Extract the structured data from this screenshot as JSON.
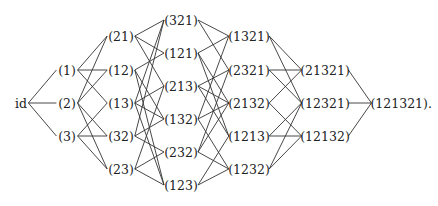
{
  "diagram": {
    "type": "hasse-diagram",
    "title": "",
    "levels": [
      {
        "rank": 0,
        "nodes": [
          {
            "id": "id",
            "label": "id",
            "x": 21,
            "y": 103
          }
        ]
      },
      {
        "rank": 1,
        "nodes": [
          {
            "id": "1",
            "label": "(1)",
            "x": 67,
            "y": 70
          },
          {
            "id": "2",
            "label": "(2)",
            "x": 67,
            "y": 103
          },
          {
            "id": "3",
            "label": "(3)",
            "x": 67,
            "y": 136
          }
        ]
      },
      {
        "rank": 2,
        "nodes": [
          {
            "id": "21",
            "label": "(21)",
            "x": 121,
            "y": 36
          },
          {
            "id": "12",
            "label": "(12)",
            "x": 121,
            "y": 70
          },
          {
            "id": "13",
            "label": "(13)",
            "x": 121,
            "y": 103
          },
          {
            "id": "32",
            "label": "(32)",
            "x": 121,
            "y": 136
          },
          {
            "id": "23",
            "label": "(23)",
            "x": 121,
            "y": 169
          }
        ]
      },
      {
        "rank": 3,
        "nodes": [
          {
            "id": "321",
            "label": "(321)",
            "x": 181,
            "y": 20
          },
          {
            "id": "121",
            "label": "(121)",
            "x": 181,
            "y": 53
          },
          {
            "id": "213",
            "label": "(213)",
            "x": 181,
            "y": 86
          },
          {
            "id": "132",
            "label": "(132)",
            "x": 181,
            "y": 119
          },
          {
            "id": "232",
            "label": "(232)",
            "x": 181,
            "y": 152
          },
          {
            "id": "123",
            "label": "(123)",
            "x": 181,
            "y": 185
          }
        ]
      },
      {
        "rank": 4,
        "nodes": [
          {
            "id": "1321",
            "label": "(1321)",
            "x": 249,
            "y": 36
          },
          {
            "id": "2321",
            "label": "(2321)",
            "x": 249,
            "y": 70
          },
          {
            "id": "2132",
            "label": "(2132)",
            "x": 249,
            "y": 103
          },
          {
            "id": "1213",
            "label": "(1213)",
            "x": 249,
            "y": 136
          },
          {
            "id": "1232",
            "label": "(1232)",
            "x": 249,
            "y": 169
          }
        ]
      },
      {
        "rank": 5,
        "nodes": [
          {
            "id": "21321",
            "label": "(21321)",
            "x": 325,
            "y": 70
          },
          {
            "id": "12321",
            "label": "(12321)",
            "x": 325,
            "y": 103
          },
          {
            "id": "12132",
            "label": "(12132)",
            "x": 325,
            "y": 136
          }
        ]
      },
      {
        "rank": 6,
        "nodes": [
          {
            "id": "121321",
            "label": "(121321).",
            "x": 398,
            "y": 103
          }
        ]
      }
    ],
    "edges": [
      [
        "id",
        "1"
      ],
      [
        "id",
        "2"
      ],
      [
        "id",
        "3"
      ],
      [
        "1",
        "21"
      ],
      [
        "1",
        "12"
      ],
      [
        "1",
        "13"
      ],
      [
        "2",
        "21"
      ],
      [
        "2",
        "12"
      ],
      [
        "2",
        "32"
      ],
      [
        "2",
        "23"
      ],
      [
        "3",
        "13"
      ],
      [
        "3",
        "32"
      ],
      [
        "3",
        "23"
      ],
      [
        "21",
        "321"
      ],
      [
        "21",
        "121"
      ],
      [
        "21",
        "213"
      ],
      [
        "12",
        "121"
      ],
      [
        "12",
        "132"
      ],
      [
        "12",
        "123"
      ],
      [
        "13",
        "321"
      ],
      [
        "13",
        "213"
      ],
      [
        "13",
        "132"
      ],
      [
        "13",
        "123"
      ],
      [
        "32",
        "321"
      ],
      [
        "32",
        "132"
      ],
      [
        "32",
        "232"
      ],
      [
        "23",
        "213"
      ],
      [
        "23",
        "232"
      ],
      [
        "23",
        "123"
      ],
      [
        "321",
        "1321"
      ],
      [
        "321",
        "2321"
      ],
      [
        "121",
        "1321"
      ],
      [
        "121",
        "2132"
      ],
      [
        "121",
        "1213"
      ],
      [
        "213",
        "2321"
      ],
      [
        "213",
        "2132"
      ],
      [
        "213",
        "1213"
      ],
      [
        "132",
        "1321"
      ],
      [
        "132",
        "2132"
      ],
      [
        "132",
        "1232"
      ],
      [
        "232",
        "2321"
      ],
      [
        "232",
        "2132"
      ],
      [
        "232",
        "1232"
      ],
      [
        "123",
        "1213"
      ],
      [
        "123",
        "1232"
      ],
      [
        "1321",
        "21321"
      ],
      [
        "1321",
        "12321"
      ],
      [
        "2321",
        "21321"
      ],
      [
        "2321",
        "12321"
      ],
      [
        "2132",
        "21321"
      ],
      [
        "2132",
        "12132"
      ],
      [
        "1213",
        "12321"
      ],
      [
        "1213",
        "12132"
      ],
      [
        "1232",
        "12321"
      ],
      [
        "1232",
        "12132"
      ],
      [
        "21321",
        "121321"
      ],
      [
        "12321",
        "121321"
      ],
      [
        "12132",
        "121321"
      ]
    ]
  }
}
